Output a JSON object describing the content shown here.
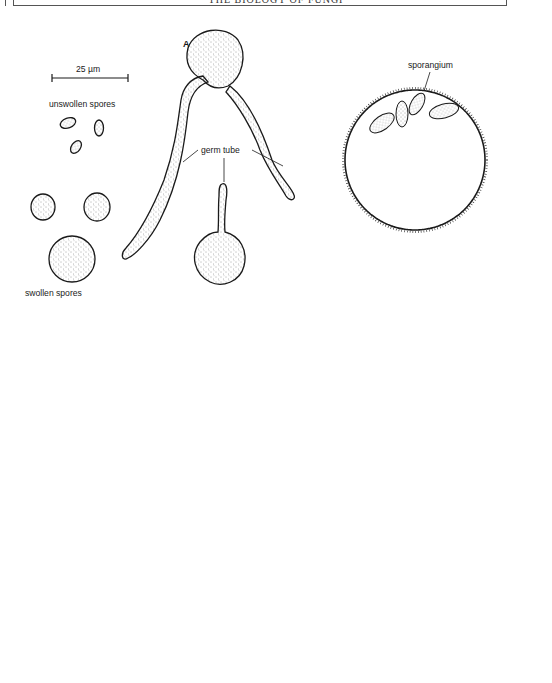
{
  "page": {
    "header": "THE BIOLOGY OF FUNGI"
  },
  "panel_a": {
    "letter": "A",
    "scale_bar": "25 µm",
    "labels": {
      "unswollen": "unswollen spores",
      "swollen": "swollen spores",
      "germ_tube": "germ tube"
    }
  },
  "panel_b": {
    "letter": "B",
    "labels": {
      "sporangiophore": "sporangiophore",
      "sporangium": "sporangium",
      "beaker": "beaker",
      "surface_mycelium_1": "surface",
      "surface_mycelium_2": "mycelium",
      "mycelium_in_agar_1": "mycelium",
      "mycelium_in_agar_2": "in agar",
      "agar": "agar"
    }
  },
  "panel_c": {
    "letter": "C",
    "scale_bar": "100 µm",
    "labels": {
      "sporangium": "sporangium",
      "spore": "spore",
      "sporangiophore": "sporangiophore"
    }
  },
  "colors": {
    "ink": "#1a1a1a",
    "paper": "#ffffff",
    "stipple": "#555555"
  }
}
